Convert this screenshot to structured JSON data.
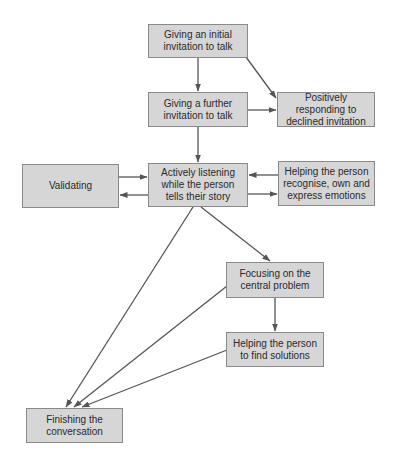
{
  "diagram": {
    "type": "flowchart",
    "colors": {
      "box_fill": "#d6d6d6",
      "box_border": "#8a8a8a",
      "edge": "#555555",
      "text": "#2a2a2a"
    },
    "nodes": {
      "initial_invitation": "Giving an initial invitation to talk",
      "further_invitation": "Giving a further invitation to talk",
      "declined_invitation": "Positively responding to declined invitation",
      "validating": "Validating",
      "active_listening": "Actively listening while the person tells their story",
      "express_emotions": "Helping the person recognise, own and express emotions",
      "central_problem": "Focusing on the central problem",
      "find_solutions": "Helping the person to find solutions",
      "finishing": "Finishing the conversation"
    },
    "edges": [
      {
        "from": "initial_invitation",
        "to": "further_invitation"
      },
      {
        "from": "initial_invitation",
        "to": "declined_invitation"
      },
      {
        "from": "further_invitation",
        "to": "declined_invitation"
      },
      {
        "from": "further_invitation",
        "to": "active_listening"
      },
      {
        "from": "validating",
        "to": "active_listening"
      },
      {
        "from": "active_listening",
        "to": "validating"
      },
      {
        "from": "express_emotions",
        "to": "active_listening"
      },
      {
        "from": "active_listening",
        "to": "express_emotions"
      },
      {
        "from": "active_listening",
        "to": "central_problem"
      },
      {
        "from": "active_listening",
        "to": "finishing"
      },
      {
        "from": "central_problem",
        "to": "find_solutions"
      },
      {
        "from": "central_problem",
        "to": "finishing"
      },
      {
        "from": "find_solutions",
        "to": "finishing"
      }
    ]
  }
}
